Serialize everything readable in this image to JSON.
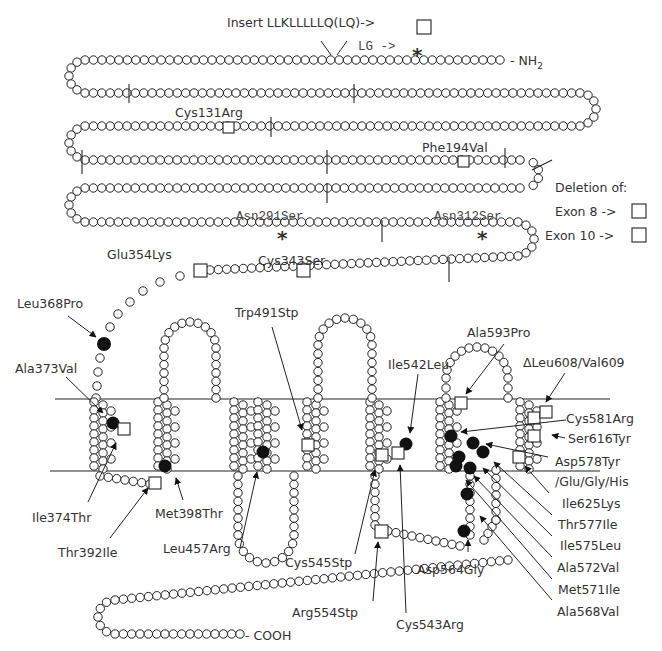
{
  "figure": {
    "termini": {
      "n_terminus": "- NH",
      "n_sub": "2",
      "c_terminus": "- COOH"
    },
    "top_annotations": {
      "insert_label": "Insert LLKLLLLLQ(LQ)->",
      "lg_label": "LG ->"
    },
    "legend": {
      "title": "Deletion of:",
      "items": [
        {
          "label": "Exon 8 ->",
          "symbol": "square"
        },
        {
          "label": "Exon 10 ->",
          "symbol": "square"
        }
      ]
    },
    "extracellular_mutations": [
      {
        "label": "Cys131Arg",
        "marker": "square"
      },
      {
        "label": "Phe194Val",
        "marker": "square"
      },
      {
        "label": "Asn291Ser",
        "marker": "asterisk"
      },
      {
        "label": "Asn312Ser",
        "marker": "asterisk"
      },
      {
        "label": "Cys343Ser",
        "marker": "square"
      },
      {
        "label": "Glu354Lys",
        "marker": "square"
      }
    ],
    "transmembrane_mutations": [
      {
        "label": "Leu368Pro",
        "marker": "filled-circle"
      },
      {
        "label": "Ala373Val",
        "marker": "filled-circle"
      },
      {
        "label": "Ile374Thr",
        "marker": "filled-circle"
      },
      {
        "label": "Thr392Ile",
        "marker": "square"
      },
      {
        "label": "Met398Thr",
        "marker": "filled-circle"
      },
      {
        "label": "Leu457Arg",
        "marker": "filled-circle"
      },
      {
        "label": "Trp491Stp",
        "marker": "square"
      },
      {
        "label": "Ile542Leu",
        "marker": "filled-circle"
      },
      {
        "label": "Cys545Stp",
        "marker": "square"
      },
      {
        "label": "Arg554Stp",
        "marker": "square"
      },
      {
        "label": "Cys543Arg",
        "marker": "square"
      },
      {
        "label": "Asp564Gly",
        "marker": "filled-circle"
      },
      {
        "label": "Ala593Pro",
        "marker": "square"
      },
      {
        "label": "ΔLeu608/Val609",
        "marker": "square"
      },
      {
        "label": "Cys581Arg",
        "marker": "filled-circle"
      },
      {
        "label": "Ser616Tyr",
        "marker": "square"
      },
      {
        "label": "Asp578Tyr",
        "marker": "filled-circle"
      },
      {
        "label": "/Glu/Gly/His",
        "marker": "filled-circle"
      },
      {
        "label": "Ile625Lys",
        "marker": "square"
      },
      {
        "label": "Thr577Ile",
        "marker": "filled-circle"
      },
      {
        "label": "Ile575Leu",
        "marker": "filled-circle"
      },
      {
        "label": "Ala572Val",
        "marker": "filled-circle"
      },
      {
        "label": "Met571Ile",
        "marker": "filled-circle"
      },
      {
        "label": "Ala568Val",
        "marker": "filled-circle"
      }
    ],
    "colors": {
      "ink": "#222222",
      "text": "#333333",
      "background": "#ffffff"
    }
  }
}
